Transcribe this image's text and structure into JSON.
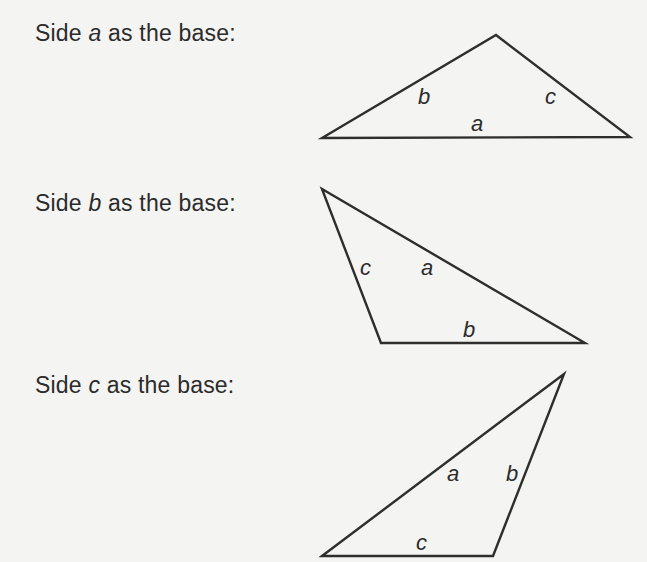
{
  "rows": [
    {
      "prompt": {
        "prefix": "Side ",
        "var": "a",
        "suffix": " as the base:"
      },
      "triangle": {
        "points": "322,138 496,35 630,137",
        "labels": [
          {
            "text": "b",
            "x": 418,
            "y": 104
          },
          {
            "text": "c",
            "x": 545,
            "y": 104
          },
          {
            "text": "a",
            "x": 471,
            "y": 131
          }
        ]
      }
    },
    {
      "prompt": {
        "prefix": "Side ",
        "var": "b",
        "suffix": " as the base:"
      },
      "triangle": {
        "points": "322,189 381,343 585,343",
        "labels": [
          {
            "text": "c",
            "x": 360,
            "y": 275
          },
          {
            "text": "a",
            "x": 421,
            "y": 275
          },
          {
            "text": "b",
            "x": 463,
            "y": 337
          }
        ]
      }
    },
    {
      "prompt": {
        "prefix": "Side ",
        "var": "c",
        "suffix": " as the base:"
      },
      "triangle": {
        "points": "322,556 564,374 493,556",
        "labels": [
          {
            "text": "a",
            "x": 447,
            "y": 481
          },
          {
            "text": "b",
            "x": 506,
            "y": 481
          },
          {
            "text": "c",
            "x": 416,
            "y": 550
          }
        ]
      }
    }
  ]
}
